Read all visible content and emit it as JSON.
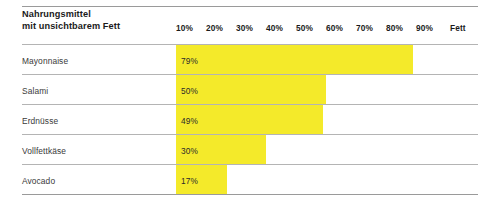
{
  "header": {
    "title_line1": "Nahrungsmittel",
    "title_line2": "mit unsichtbarem Fett"
  },
  "colors": {
    "bar": "#F4EA2A",
    "rule": "#9a9a9a",
    "rule_light": "#b4b4b4",
    "text": "#1b1b1b",
    "row_text": "#3a3a3a",
    "background": "#ffffff"
  },
  "axis": {
    "unit_label": "Fett",
    "ticks": [
      "10%",
      "20%",
      "30%",
      "40%",
      "50%",
      "60%",
      "70%",
      "80%",
      "90%"
    ]
  },
  "chart_data": {
    "type": "bar",
    "orientation": "horizontal",
    "title": "Nahrungsmittel mit unsichtbarem Fett",
    "xlabel": "Fett",
    "ylabel": "",
    "xlim": [
      0,
      100
    ],
    "grid": false,
    "legend": null,
    "value_suffix": "%",
    "categories": [
      "Mayonnaise",
      "Salami",
      "Erdnüsse",
      "Vollfettkäse",
      "Avocado"
    ],
    "values": [
      79,
      50,
      49,
      30,
      17
    ],
    "value_labels": [
      "79%",
      "50%",
      "49%",
      "30%",
      "17%"
    ]
  }
}
